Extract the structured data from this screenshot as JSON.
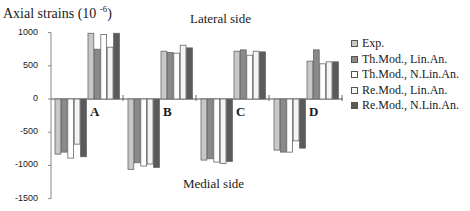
{
  "chart_data": {
    "type": "bar",
    "title": "",
    "ylabel": "Axial strains (10 -6)",
    "ylabel_base": "Axial strains (10",
    "ylabel_exp": "-6",
    "ylabel_close": ")",
    "xlabel": "",
    "ylim": [
      -1500,
      1000
    ],
    "yticks": [
      1000,
      500,
      0,
      -500,
      -1000,
      -1500
    ],
    "ytick_labels": [
      "1000",
      "500",
      "0",
      "-500",
      "-1000",
      "-1500"
    ],
    "grid": false,
    "legend_position": "right",
    "annotations": {
      "top": "Lateral side",
      "bottom": "Medial side"
    },
    "categories": [
      "A",
      "B",
      "C",
      "D"
    ],
    "sides": [
      "Medial",
      "Lateral"
    ],
    "series": [
      {
        "name": "Exp.",
        "color": "#c8c8c8",
        "medial": [
          -830,
          -1060,
          -920,
          -770
        ],
        "lateral": [
          990,
          720,
          720,
          570
        ]
      },
      {
        "name": "Th.Mod., Lin.An.",
        "color": "#8a8a8a",
        "medial": [
          -800,
          -960,
          -900,
          -800
        ],
        "lateral": [
          750,
          700,
          740,
          740
        ]
      },
      {
        "name": "Th.Mod., N.Lin.An.",
        "color": "#ffffff",
        "medial": [
          -890,
          -1010,
          -950,
          -800
        ],
        "lateral": [
          970,
          690,
          660,
          530
        ]
      },
      {
        "name": "Re.Mod., Lin.An.",
        "color": "#f4f4f4",
        "medial": [
          -680,
          -980,
          -970,
          -630
        ],
        "lateral": [
          780,
          810,
          720,
          560
        ]
      },
      {
        "name": "Re.Mod., N.Lin.An.",
        "color": "#5a5a5a",
        "medial": [
          -870,
          -1030,
          -940,
          -740
        ],
        "lateral": [
          990,
          770,
          710,
          560
        ]
      }
    ]
  }
}
